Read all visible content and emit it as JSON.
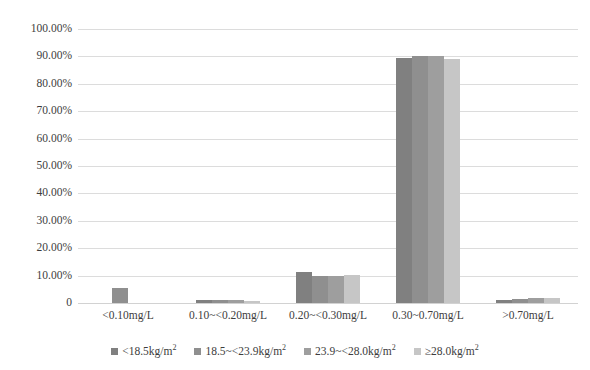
{
  "chart_data": {
    "type": "bar",
    "title": "",
    "subtitle": "",
    "xlabel": "",
    "ylabel": "",
    "categories": [
      "<0.10mg/L",
      "0.10~<0.20mg/L",
      "0.20~<0.30mg/L",
      "0.30~0.70mg/L",
      ">0.70mg/L"
    ],
    "ylim": [
      0,
      100
    ],
    "y_ticks": [
      0,
      10,
      20,
      30,
      40,
      50,
      60,
      70,
      80,
      90,
      100
    ],
    "y_tick_labels": [
      "0",
      "10.00%",
      "20.00%",
      "30.00%",
      "40.00%",
      "50.00%",
      "60.00%",
      "70.00%",
      "80.00%",
      "90.00%",
      "100.00%"
    ],
    "grid": true,
    "legend_position": "bottom",
    "series": [
      {
        "name": "<18.5kg/m²",
        "name_base": "<18.5kg/m",
        "name_sup": "2",
        "color": "#808080",
        "values": [
          0,
          1.2,
          11.5,
          89.3,
          1.0
        ]
      },
      {
        "name": "18.5~<23.9kg/m²",
        "name_base": "18.5~<23.9kg/m",
        "name_sup": "2",
        "color": "#8f8f8f",
        "values": [
          5.5,
          1.2,
          9.8,
          90.2,
          1.4
        ]
      },
      {
        "name": "23.9~<28.0kg/m²",
        "name_base": "23.9~<28.0kg/m",
        "name_sup": "2",
        "color": "#9e9e9e",
        "values": [
          0,
          1.1,
          9.7,
          90.3,
          1.7
        ]
      },
      {
        "name": "≥28.0kg/m²",
        "name_base": "≥28.0kg/m",
        "name_sup": "2",
        "color": "#c6c6c6",
        "values": [
          0,
          0.9,
          10.2,
          89.1,
          1.8
        ]
      }
    ]
  },
  "colors": {
    "gridline": "#dcdcdc",
    "baseline": "#d2d2d2",
    "text": "#3d3d3d",
    "background": "#ffffff"
  }
}
